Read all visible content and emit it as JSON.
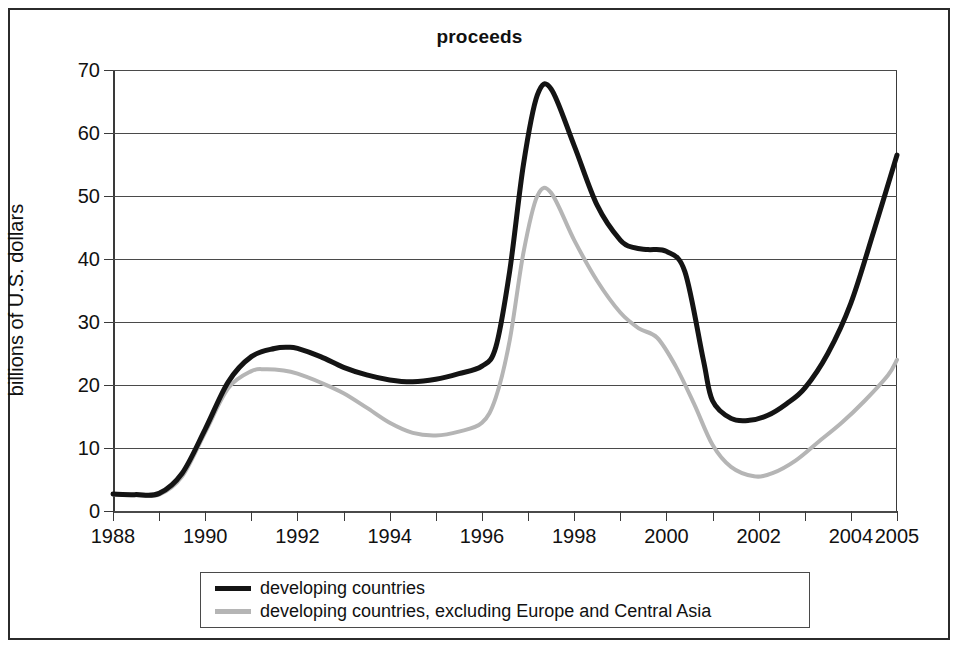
{
  "chart_data": {
    "type": "line",
    "title": "proceeds",
    "xlabel": "",
    "ylabel": "billions of U.S. dollars",
    "xlim": [
      1988,
      2005
    ],
    "ylim": [
      0,
      70
    ],
    "ytick_values": [
      0,
      10,
      20,
      30,
      40,
      50,
      60,
      70
    ],
    "ytick_labels": [
      "0",
      "10",
      "20",
      "30",
      "40",
      "50",
      "60",
      "70"
    ],
    "xtick_values": [
      1988,
      1990,
      1992,
      1994,
      1996,
      1998,
      2000,
      2002,
      2004,
      2005
    ],
    "xtick_labels": [
      "1988",
      "1990",
      "1992",
      "1994",
      "1996",
      "1998",
      "2000",
      "2002",
      "2004",
      "2005"
    ],
    "xtick_minor_values": [
      1989,
      1991,
      1993,
      1995,
      1997,
      1999,
      2001,
      2003
    ],
    "grid": "horizontal",
    "legend_position": "below",
    "colors": {
      "developing_countries": "#141414",
      "developing_excl_europe_central_asia": "#b5b5b5",
      "gridline": "#4a4a4a",
      "axis": "#3a3a3a",
      "border": "#2b2b2b",
      "background": "#ffffff"
    },
    "series": [
      {
        "name": "developing countries",
        "color": "#141414",
        "x": [
          1988,
          1988.5,
          1989,
          1989.5,
          1990,
          1990.5,
          1991,
          1991.5,
          1991.8,
          1992,
          1992.5,
          1993,
          1993.5,
          1994,
          1994.5,
          1995,
          1995.5,
          1996,
          1996.3,
          1996.6,
          1996.9,
          1997.2,
          1997.5,
          1998,
          1998.5,
          1999,
          1999.3,
          1999.6,
          2000,
          2000.4,
          2000.8,
          2001,
          2001.4,
          2001.8,
          2002.2,
          2002.6,
          2003,
          2003.5,
          2004,
          2004.5,
          2005
        ],
        "y": [
          2.7,
          2.6,
          2.8,
          6.0,
          13.0,
          20.5,
          24.5,
          25.8,
          26.0,
          25.8,
          24.5,
          22.8,
          21.6,
          20.8,
          20.5,
          20.9,
          21.8,
          23.0,
          26.0,
          38.0,
          55.0,
          66.0,
          67.0,
          58.0,
          48.5,
          43.0,
          41.8,
          41.5,
          41.2,
          38.0,
          24.0,
          17.5,
          14.7,
          14.4,
          15.2,
          17.0,
          19.5,
          25.0,
          33.0,
          44.5,
          56.5
        ],
        "value_at_start": 2.7,
        "peak_1991": 26.0,
        "trough_1994": 20.5,
        "peak_1997": 67.0,
        "plateau_1999_2000": 41.5,
        "trough_2001_2002": 14.4,
        "value_at_end": 56.5
      },
      {
        "name": "developing countries, excluding Europe and Central Asia",
        "color": "#b5b5b5",
        "x": [
          1988,
          1988.5,
          1989,
          1989.5,
          1990,
          1990.5,
          1991,
          1991.3,
          1991.7,
          1992,
          1992.5,
          1993,
          1993.5,
          1994,
          1994.5,
          1995,
          1995.5,
          1996,
          1996.3,
          1996.6,
          1996.9,
          1997.2,
          1997.5,
          1998,
          1998.5,
          1999,
          1999.4,
          1999.8,
          2000.2,
          2000.6,
          2001,
          2001.4,
          2001.9,
          2002.3,
          2002.8,
          2003.3,
          2003.8,
          2004.3,
          2004.8,
          2005
        ],
        "y": [
          2.6,
          2.5,
          2.6,
          5.5,
          12.5,
          19.5,
          22.2,
          22.5,
          22.3,
          21.8,
          20.4,
          18.7,
          16.4,
          14.0,
          12.4,
          12.0,
          12.6,
          14.0,
          18.0,
          27.0,
          41.0,
          50.0,
          50.5,
          43.0,
          36.5,
          31.5,
          29.0,
          27.5,
          23.0,
          17.0,
          10.5,
          7.0,
          5.5,
          6.0,
          8.0,
          11.0,
          14.0,
          17.5,
          21.5,
          24.0
        ],
        "value_at_start": 2.6,
        "peak_1991": 22.5,
        "trough_1995": 12.0,
        "peak_1997": 50.5,
        "shoulder_1999_2000": 27.5,
        "trough_2002": 5.5,
        "value_at_end": 24.0
      }
    ],
    "legend": [
      {
        "label": "developing countries",
        "style": "thick",
        "color": "#141414"
      },
      {
        "label": "developing countries, excluding Europe and Central Asia",
        "style": "thin",
        "color": "#b5b5b5"
      }
    ]
  }
}
